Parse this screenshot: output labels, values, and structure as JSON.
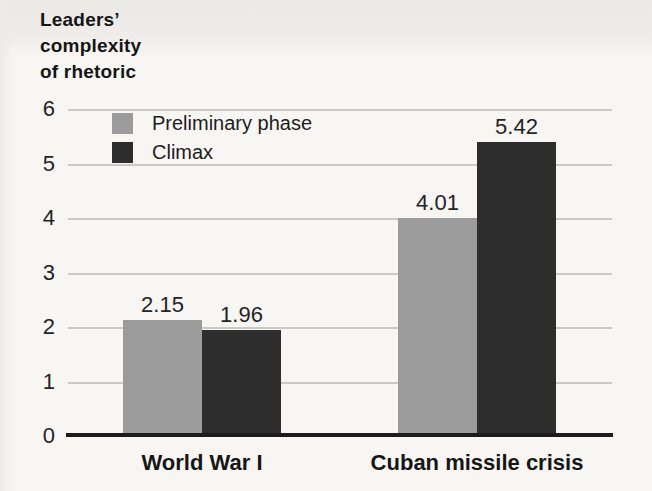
{
  "page": {
    "background": "#f7f6f3",
    "top_bleed_band": "#ebe9e5"
  },
  "chart_data": {
    "type": "bar",
    "title": "Leaders’\ncomplexity\nof rhetoric",
    "categories": [
      "World War I",
      "Cuban missile crisis"
    ],
    "series": [
      {
        "name": "Preliminary phase",
        "color": "#9b9b9b",
        "values": [
          2.15,
          4.01
        ]
      },
      {
        "name": "Climax",
        "color": "#2d2d2d",
        "values": [
          1.96,
          5.42
        ]
      }
    ],
    "xlabel": "",
    "ylabel": "",
    "ylim": [
      0,
      6
    ],
    "ytick_step": 1,
    "yticks": [
      "0",
      "1",
      "2",
      "3",
      "4",
      "5",
      "6"
    ],
    "grid": true,
    "gridline_color": "#c9c9c9",
    "axis_color": "#1c1c1c",
    "legend_position": "upper-left-inside",
    "value_label_decimals": 2
  }
}
